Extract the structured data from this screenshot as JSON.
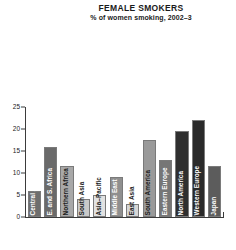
{
  "header": {
    "title": "FEMALE SMOKERS",
    "subtitle": "% of women smoking, 2002–3"
  },
  "chart_data": {
    "type": "bar",
    "title": "FEMALE SMOKERS",
    "subtitle": "% of women smoking, 2002–3",
    "xlabel": "",
    "ylabel": "",
    "ylim": [
      0,
      25
    ],
    "yticks": [
      0,
      5,
      10,
      15,
      20,
      25
    ],
    "ytick_labels": [
      "0",
      "5",
      "10",
      "15",
      "20",
      "25"
    ],
    "grid": false,
    "legend": "none",
    "categories": [
      "Central Africa",
      "E. and S. Africa",
      "Northern Africa",
      "South Asia",
      "Asia–Pacific",
      "Middle East",
      "East Asia",
      "South America",
      "Eastern Europe",
      "North America",
      "Western Europe",
      "Japan"
    ],
    "values": [
      6,
      16,
      11.5,
      4,
      5,
      9,
      3,
      17.5,
      13,
      19.5,
      22,
      11.5
    ],
    "bar_colors": [
      "#6e6e6e",
      "#6a6a6a",
      "#a8a8a8",
      "#c9c9c9",
      "#e2e2e2",
      "#8f8f8f",
      "#d6d6d6",
      "#9a9a9a",
      "#767676",
      "#2f2f2f",
      "#2a2a2a",
      "#5c5c5c"
    ],
    "label_contrast": [
      "light",
      "light",
      "dark",
      "dark",
      "dark",
      "light",
      "dark",
      "dark",
      "light",
      "light",
      "light",
      "light"
    ]
  },
  "colors": {
    "axis": "#3b3b3b",
    "background": "#ffffff",
    "text": "#1a1a1a"
  }
}
